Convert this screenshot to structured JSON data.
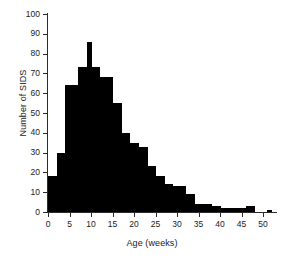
{
  "chart_data": {
    "type": "bar",
    "title": "",
    "xlabel": "Age (weeks)",
    "ylabel": "Number of SIDS",
    "xlim": [
      0,
      53
    ],
    "ylim": [
      0,
      100
    ],
    "bin_width": 1,
    "grid": false,
    "legend": null,
    "bar_color": "#000000",
    "axis_color": "#2b2b2b",
    "x_ticks": [
      0,
      5,
      10,
      15,
      20,
      25,
      30,
      35,
      40,
      45,
      50
    ],
    "x_tick_labels": [
      "0",
      "5",
      "10",
      "15",
      "20",
      "25",
      "30",
      "35",
      "40",
      "45",
      "50"
    ],
    "y_ticks": [
      0,
      10,
      20,
      30,
      40,
      50,
      60,
      70,
      80,
      90,
      100
    ],
    "y_tick_labels": [
      "0",
      "10",
      "20",
      "30",
      "40",
      "50",
      "60",
      "70",
      "80",
      "90",
      "100"
    ],
    "categories": [
      0,
      1,
      2,
      3,
      4,
      5,
      6,
      7,
      8,
      9,
      10,
      11,
      12,
      13,
      14,
      15,
      16,
      17,
      18,
      19,
      20,
      21,
      22,
      23,
      24,
      25,
      26,
      27,
      28,
      29,
      30,
      31,
      32,
      33,
      34,
      35,
      36,
      37,
      38,
      39,
      40,
      41,
      42,
      43,
      44,
      45,
      46,
      47,
      48,
      49,
      50,
      51,
      52
    ],
    "values": [
      18,
      18,
      30,
      30,
      64,
      64,
      64,
      73,
      73,
      86,
      73,
      73,
      68,
      68,
      68,
      55,
      55,
      40,
      40,
      35,
      35,
      33,
      33,
      23,
      23,
      18,
      18,
      14,
      14,
      13,
      13,
      13,
      9,
      9,
      4,
      4,
      4,
      4,
      3,
      3,
      2,
      2,
      2,
      2,
      2,
      2,
      3,
      3,
      0,
      0,
      0,
      1,
      0
    ]
  }
}
